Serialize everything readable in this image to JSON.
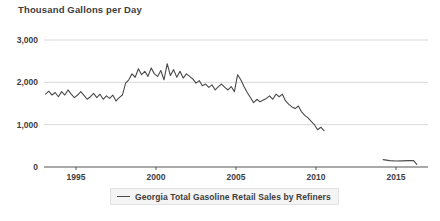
{
  "chart_data": {
    "type": "line",
    "title": "Thousand Gallons per Day",
    "xlabel": "",
    "ylabel": "Thousand Gallons per Day",
    "ylim": [
      0,
      3000
    ],
    "xlim": [
      1993.0,
      2017.0
    ],
    "yticks": [
      0,
      1000,
      2000,
      3000
    ],
    "ytick_labels": [
      "0",
      "1,000",
      "2,000",
      "3,000"
    ],
    "xticks": [
      1995,
      2000,
      2005,
      2010,
      2015
    ],
    "xtick_labels": [
      "1995",
      "2000",
      "2005",
      "2010",
      "2015"
    ],
    "grid": "horizontal",
    "legend_position": "bottom-center",
    "line_color": "#4a4a4a",
    "axis_color": "#555555",
    "grid_color": "#d9d9d9",
    "series": [
      {
        "name": "Georgia Total Gasoline Retail Sales by Refiners",
        "x": [
          1993.1,
          1993.3,
          1993.5,
          1993.7,
          1993.9,
          1994.1,
          1994.3,
          1994.5,
          1994.7,
          1994.9,
          1995.1,
          1995.3,
          1995.5,
          1995.7,
          1995.9,
          1996.1,
          1996.3,
          1996.5,
          1996.7,
          1996.9,
          1997.1,
          1997.3,
          1997.5,
          1997.7,
          1997.9,
          1998.1,
          1998.3,
          1998.5,
          1998.7,
          1998.9,
          1999.1,
          1999.3,
          1999.5,
          1999.7,
          1999.9,
          2000.1,
          2000.3,
          2000.5,
          2000.7,
          2000.9,
          2001.1,
          2001.3,
          2001.5,
          2001.7,
          2001.9,
          2002.1,
          2002.3,
          2002.5,
          2002.7,
          2002.9,
          2003.1,
          2003.3,
          2003.5,
          2003.7,
          2003.9,
          2004.1,
          2004.3,
          2004.5,
          2004.7,
          2004.9,
          2005.1,
          2005.3,
          2005.5,
          2005.7,
          2005.9,
          2006.1,
          2006.3,
          2006.5,
          2006.7,
          2006.9,
          2007.1,
          2007.3,
          2007.5,
          2007.7,
          2007.9,
          2008.1,
          2008.3,
          2008.5,
          2008.7,
          2008.9,
          2009.1,
          2009.3,
          2009.5,
          2009.7,
          2009.9,
          2010.1,
          2010.3,
          2010.5
        ],
        "values": [
          1720,
          1790,
          1700,
          1760,
          1660,
          1780,
          1700,
          1820,
          1720,
          1640,
          1700,
          1780,
          1690,
          1600,
          1660,
          1740,
          1640,
          1720,
          1600,
          1680,
          1620,
          1700,
          1560,
          1640,
          1700,
          1980,
          2060,
          2200,
          2120,
          2320,
          2180,
          2260,
          2140,
          2340,
          2200,
          2140,
          2280,
          2060,
          2440,
          2160,
          2300,
          2120,
          2260,
          2100,
          2200,
          2140,
          2080,
          1980,
          2040,
          1920,
          1960,
          1880,
          1940,
          1820,
          1900,
          1960,
          1880,
          1820,
          1900,
          1780,
          2180,
          2060,
          1900,
          1760,
          1640,
          1520,
          1600,
          1540,
          1580,
          1620,
          1680,
          1600,
          1720,
          1660,
          1720,
          1560,
          1480,
          1420,
          1380,
          1440,
          1300,
          1220,
          1160,
          1080,
          1000,
          880,
          940,
          860
        ]
      },
      {
        "name": "Georgia Total Gasoline Retail Sales by Refiners (late segment)",
        "x": [
          2014.2,
          2014.6,
          2015.0,
          2015.4,
          2015.8,
          2016.1,
          2016.3
        ],
        "values": [
          175,
          150,
          140,
          145,
          150,
          150,
          60
        ]
      }
    ]
  },
  "legend": {
    "entries": [
      {
        "label": "Georgia Total Gasoline Retail Sales by Refiners",
        "color": "#4a4a4a"
      }
    ]
  }
}
